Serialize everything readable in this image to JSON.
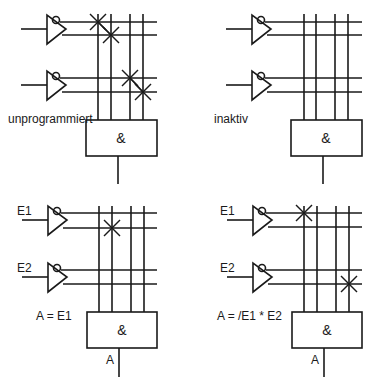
{
  "panels": [
    {
      "id": "top-left",
      "caption": "unprogrammiert",
      "gate_label": "&",
      "inputs": [],
      "output_label": "",
      "expression": "",
      "fuses_intact": [
        [
          0,
          0
        ],
        [
          1,
          1
        ],
        [
          2,
          2
        ],
        [
          3,
          3
        ]
      ]
    },
    {
      "id": "top-right",
      "caption": "inaktiv",
      "gate_label": "&",
      "inputs": [],
      "output_label": "",
      "expression": "",
      "fuses_intact": []
    },
    {
      "id": "bottom-left",
      "caption": "",
      "gate_label": "&",
      "inputs": [
        "E1",
        "E2"
      ],
      "output_label": "A",
      "expression": "A = E1",
      "fuses_intact": [
        [
          1,
          1
        ]
      ]
    },
    {
      "id": "bottom-right",
      "caption": "",
      "gate_label": "&",
      "inputs": [
        "E1",
        "E2"
      ],
      "output_label": "A",
      "expression": "A = /E1 * E2",
      "fuses_intact": [
        [
          0,
          0
        ],
        [
          3,
          3
        ]
      ]
    }
  ]
}
